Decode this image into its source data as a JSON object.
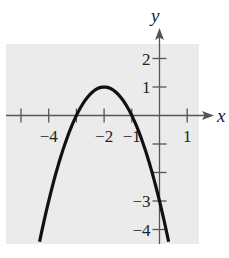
{
  "chart_data": {
    "type": "line",
    "title": "",
    "function": "y = -(x + 2)^2 + 1",
    "xlabel": "x",
    "ylabel": "y",
    "xlim": [
      -5.4,
      1.4
    ],
    "ylim": [
      -4.5,
      2.5
    ],
    "grid": false,
    "background": "#ebebeb",
    "curve_color": "#111111",
    "x_ticks": [
      -5,
      -4,
      -3,
      -2,
      -1,
      1
    ],
    "x_tick_labels": [
      {
        "value": -4,
        "text": "−4"
      },
      {
        "value": -2,
        "text": "−2"
      },
      {
        "value": -1,
        "text": "−1"
      },
      {
        "value": 1,
        "text": "1"
      }
    ],
    "y_ticks": [
      2,
      1,
      -1,
      -2,
      -3,
      -4
    ],
    "y_tick_labels": [
      {
        "value": 2,
        "text": "2"
      },
      {
        "value": 1,
        "text": "1"
      },
      {
        "value": -3,
        "text": "−3"
      },
      {
        "value": -4,
        "text": "−4"
      }
    ],
    "series": [
      {
        "name": "parabola",
        "x": [
          -4.33,
          -4,
          -3.5,
          -3,
          -2.5,
          -2,
          -1.5,
          -1,
          -0.5,
          0,
          0.33
        ],
        "y": [
          -4.43,
          -3,
          -1.25,
          0,
          0.75,
          1,
          0.75,
          0,
          -1.25,
          -3,
          -4.43
        ]
      }
    ],
    "key_points": {
      "vertex": [
        -2,
        1
      ],
      "x_intercepts": [
        -3,
        -1
      ],
      "y_intercept": [
        0,
        -3
      ]
    }
  }
}
